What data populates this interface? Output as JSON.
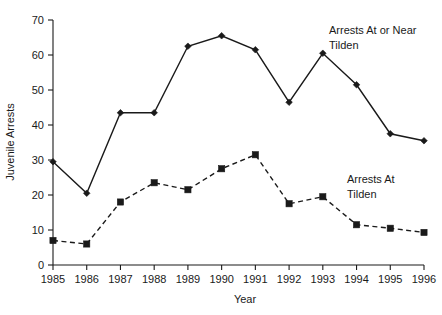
{
  "chart_data": {
    "type": "line",
    "title": "",
    "xlabel": "Year",
    "ylabel": "Juvenile Arrests",
    "categories": [
      "1985",
      "1986",
      "1987",
      "1988",
      "1989",
      "1990",
      "1991",
      "1992",
      "1993",
      "1994",
      "1995",
      "1996"
    ],
    "x": [
      1985,
      1986,
      1987,
      1988,
      1989,
      1990,
      1991,
      1992,
      1993,
      1994,
      1995,
      1996
    ],
    "xlim": [
      1985,
      1996
    ],
    "ylim": [
      0,
      70
    ],
    "yticks": [
      0,
      10,
      20,
      30,
      40,
      50,
      60,
      70
    ],
    "ytick_labels": [
      "0",
      "10",
      "20",
      "30",
      "40",
      "50",
      "60",
      "70"
    ],
    "grid": false,
    "legend_position": "inline-annotation",
    "series": [
      {
        "name": "Arrests At or Near Tilden",
        "marker": "diamond",
        "linestyle": "solid",
        "color": "#1a1a1a",
        "values": [
          29.5,
          20.5,
          43.5,
          43.5,
          62.5,
          65.5,
          61.5,
          46.5,
          60.5,
          51.5,
          37.5,
          35.5
        ]
      },
      {
        "name": "Arrests At Tilden",
        "marker": "square",
        "linestyle": "dashed",
        "color": "#1a1a1a",
        "values": [
          7.0,
          6.0,
          18.0,
          23.5,
          21.5,
          27.5,
          31.5,
          17.5,
          19.5,
          11.5,
          10.5,
          9.3
        ]
      }
    ],
    "annotations": [
      {
        "text_line1": "Arrests At or Near",
        "text_line2": "Tilden",
        "x": 329,
        "y": 34
      },
      {
        "text_line1": "Arrests At",
        "text_line2": "Tilden",
        "x": 347,
        "y": 183
      }
    ]
  }
}
